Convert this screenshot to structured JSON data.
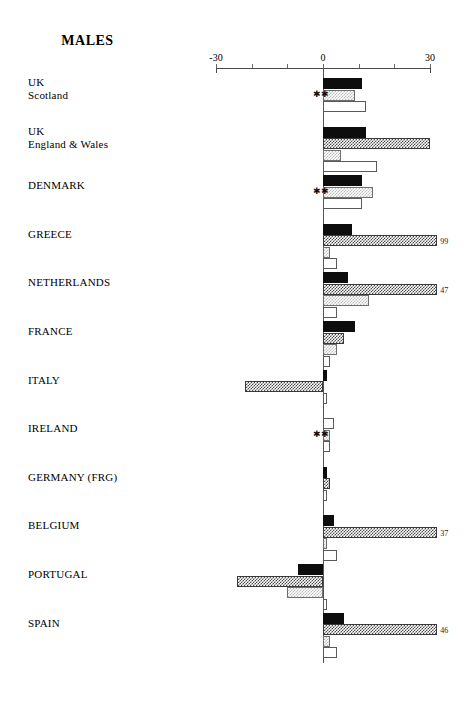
{
  "chart_data": {
    "type": "bar",
    "orientation": "horizontal",
    "title": "MALES",
    "xlabel": "",
    "ylabel": "",
    "xlim": [
      -30,
      30
    ],
    "grid": false,
    "legend_position": "none",
    "axis_tick_labels": [
      "-30",
      "0",
      "30"
    ],
    "axis_tick_values": [
      -30,
      -20,
      -10,
      0,
      10,
      20,
      30
    ],
    "categories": [
      "UK\nScotland",
      "UK\nEngland & Wales",
      "DENMARK",
      "GREECE",
      "NETHERLANDS",
      "FRANCE",
      "ITALY",
      "IRELAND",
      "GERMANY (FRG)",
      "BELGIUM",
      "PORTUGAL",
      "SPAIN"
    ],
    "series": [
      {
        "name": "series-1",
        "pattern": "solid-black",
        "values": [
          11,
          12,
          11,
          8,
          7,
          9,
          1,
          0.5,
          0.5,
          3,
          -7,
          6
        ]
      },
      {
        "name": "series-2",
        "pattern": "dark-checker",
        "values": [
          null,
          30,
          null,
          99,
          47,
          6,
          -22,
          1,
          2,
          37,
          -24,
          46
        ]
      },
      {
        "name": "series-3",
        "pattern": "light-stipple",
        "values": [
          9,
          5,
          14,
          2,
          13,
          4,
          null,
          2,
          null,
          1,
          -10,
          2
        ]
      },
      {
        "name": "series-4",
        "pattern": "hollow-white",
        "values": [
          12,
          15,
          11,
          4,
          4,
          2,
          1,
          3,
          1,
          4,
          1,
          4
        ]
      }
    ],
    "overflow_value_labels": [
      {
        "category": "GREECE",
        "series": "series-2",
        "label": "99"
      },
      {
        "category": "NETHERLANDS",
        "series": "series-2",
        "label": "47"
      },
      {
        "category": "BELGIUM",
        "series": "series-2",
        "label": "37"
      },
      {
        "category": "SPAIN",
        "series": "series-2",
        "label": "46"
      }
    ],
    "significance_markers": [
      {
        "category": "UK\nScotland",
        "label": "✱✱"
      },
      {
        "category": "DENMARK",
        "label": "✱✱"
      },
      {
        "category": "IRELAND",
        "label": "✱✱"
      }
    ]
  },
  "axis": {
    "left_label": "-30",
    "center_label": "0",
    "right_label": "30"
  },
  "groups": [
    {
      "label": "UK\nScotland",
      "marker": "✱✱",
      "bars": [
        {
          "style": "solid",
          "value": 11,
          "value_label": ""
        },
        {
          "style": "stipple",
          "value": 9,
          "value_label": ""
        },
        {
          "style": "hollow",
          "value": 12,
          "value_label": ""
        }
      ]
    },
    {
      "label": "UK\nEngland & Wales",
      "marker": "",
      "bars": [
        {
          "style": "solid",
          "value": 12,
          "value_label": ""
        },
        {
          "style": "checker",
          "value": 30,
          "value_label": ""
        },
        {
          "style": "stipple",
          "value": 5,
          "value_label": ""
        },
        {
          "style": "hollow",
          "value": 15,
          "value_label": ""
        }
      ]
    },
    {
      "label": "DENMARK",
      "marker": "✱✱",
      "bars": [
        {
          "style": "solid",
          "value": 11,
          "value_label": ""
        },
        {
          "style": "stipple",
          "value": 14,
          "value_label": ""
        },
        {
          "style": "hollow",
          "value": 11,
          "value_label": ""
        }
      ]
    },
    {
      "label": "GREECE",
      "marker": "",
      "bars": [
        {
          "style": "solid",
          "value": 8,
          "value_label": ""
        },
        {
          "style": "checker",
          "value": 33,
          "value_label": "99"
        },
        {
          "style": "stipple",
          "value": 2,
          "value_label": ""
        },
        {
          "style": "hollow",
          "value": 4,
          "value_label": ""
        }
      ]
    },
    {
      "label": "NETHERLANDS",
      "marker": "",
      "bars": [
        {
          "style": "solid",
          "value": 7,
          "value_label": ""
        },
        {
          "style": "checker",
          "value": 32,
          "value_label": "47"
        },
        {
          "style": "stipple",
          "value": 13,
          "value_label": ""
        },
        {
          "style": "hollow",
          "value": 4,
          "value_label": ""
        }
      ]
    },
    {
      "label": "FRANCE",
      "marker": "",
      "bars": [
        {
          "style": "solid",
          "value": 9,
          "value_label": ""
        },
        {
          "style": "checker",
          "value": 6,
          "value_label": ""
        },
        {
          "style": "stipple",
          "value": 4,
          "value_label": ""
        },
        {
          "style": "hollow",
          "value": 2,
          "value_label": ""
        }
      ]
    },
    {
      "label": "ITALY",
      "marker": "",
      "bars": [
        {
          "style": "solid",
          "value": 1,
          "value_label": ""
        },
        {
          "style": "checker",
          "value": -22,
          "value_label": ""
        },
        {
          "style": "hollow",
          "value": 1,
          "value_label": ""
        }
      ]
    },
    {
      "label": "IRELAND",
      "marker": "✱✱",
      "bars": [
        {
          "style": "hollow",
          "value": 3,
          "value_label": ""
        },
        {
          "style": "stipple",
          "value": 2,
          "value_label": ""
        },
        {
          "style": "hollow",
          "value": 2,
          "value_label": ""
        }
      ]
    },
    {
      "label": "GERMANY (FRG)",
      "marker": "",
      "bars": [
        {
          "style": "solid",
          "value": 1,
          "value_label": ""
        },
        {
          "style": "checker",
          "value": 2,
          "value_label": ""
        },
        {
          "style": "hollow",
          "value": 1,
          "value_label": ""
        }
      ]
    },
    {
      "label": "BELGIUM",
      "marker": "",
      "bars": [
        {
          "style": "solid",
          "value": 3,
          "value_label": ""
        },
        {
          "style": "checker",
          "value": 32,
          "value_label": "37"
        },
        {
          "style": "stipple",
          "value": 1,
          "value_label": ""
        },
        {
          "style": "hollow",
          "value": 4,
          "value_label": ""
        }
      ]
    },
    {
      "label": "PORTUGAL",
      "marker": "",
      "bars": [
        {
          "style": "solid",
          "value": -7,
          "value_label": ""
        },
        {
          "style": "checker",
          "value": -24,
          "value_label": ""
        },
        {
          "style": "stipple",
          "value": -10,
          "value_label": ""
        },
        {
          "style": "hollow",
          "value": 1,
          "value_label": ""
        }
      ]
    },
    {
      "label": "SPAIN",
      "marker": "",
      "bars": [
        {
          "style": "solid",
          "value": 6,
          "value_label": ""
        },
        {
          "style": "checker",
          "value": 32,
          "value_label": "46"
        },
        {
          "style": "stipple",
          "value": 2,
          "value_label": ""
        },
        {
          "style": "hollow",
          "value": 4,
          "value_label": ""
        }
      ]
    }
  ]
}
